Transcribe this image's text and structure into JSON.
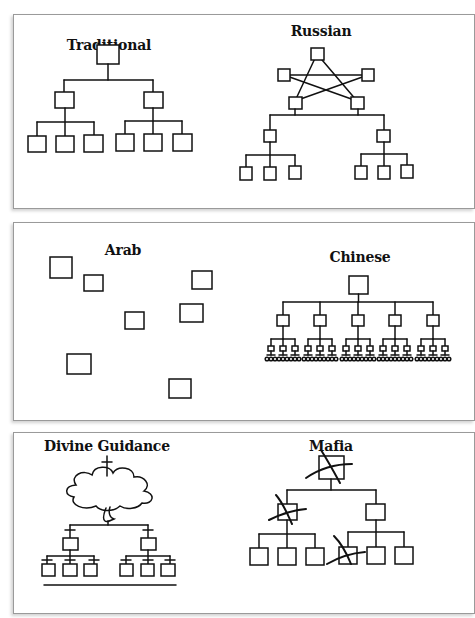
{
  "figure": {
    "panels": [
      {
        "id": "top",
        "diagrams": [
          {
            "title": "Traditional",
            "structure": "tree: 1 boss → 2 managers → 3 workers each"
          },
          {
            "title": "Russian",
            "structure": "5-node pentagram (star) at top; lower two star nodes lead a tree: 2 managers → 3 workers each"
          }
        ]
      },
      {
        "id": "middle",
        "diagrams": [
          {
            "title": "Arab",
            "structure": "8 unconnected scattered boxes"
          },
          {
            "title": "Chinese",
            "structure": "tree: 1 boss → 5 managers → 3 sub-managers each → many small nodes"
          }
        ]
      },
      {
        "id": "bottom",
        "diagrams": [
          {
            "title": "Divine Guidance",
            "structure": "cross atop cloud → tree: 2 managers → 3 workers each, each with small crosses; base line"
          },
          {
            "title": "Mafia",
            "structure": "tree: 1 boss → 2 managers → 3 workers each; boss, left manager and one worker crossed out"
          }
        ]
      }
    ],
    "colors": {
      "line": "#111111",
      "panel_border": "#9a9a9a",
      "background": "#ffffff"
    }
  }
}
